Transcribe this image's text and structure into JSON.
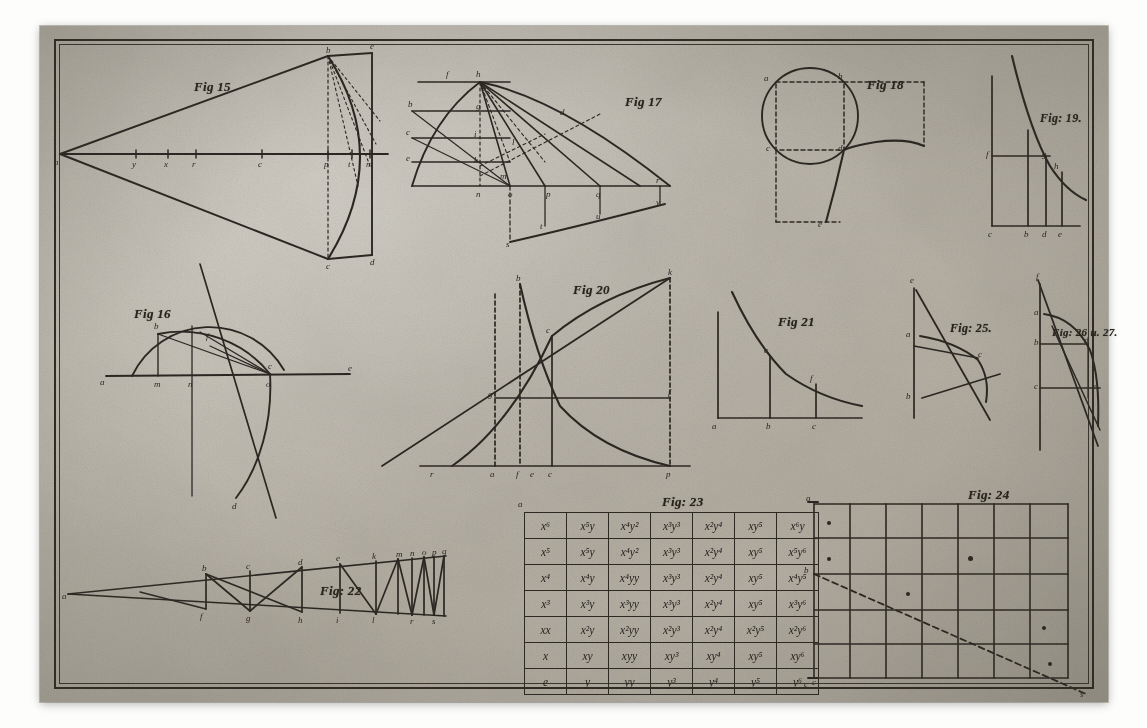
{
  "plate": {
    "title": "Engraved geometrical plate",
    "paper_color": "#bab5a9",
    "ink_color": "#2b2822",
    "border_style": "double ruled rectangle"
  },
  "figures": [
    {
      "id": "fig15",
      "label": "Fig 15",
      "caption_x": 154,
      "caption_y": 53,
      "size": 13,
      "description": "Elongated triangle (cone section) from apex at left to a vertical line at right, with a circular arc bulging right and dotted chords from the apex point",
      "point_labels": [
        "a",
        "b",
        "c",
        "d",
        "e",
        "f",
        "g",
        "h",
        "i",
        "k",
        "m",
        "n"
      ]
    },
    {
      "id": "fig16",
      "label": "Fig 16",
      "caption_x": 94,
      "caption_y": 280,
      "size": 13,
      "description": "Semicircle on a horizontal axis with an oblique tangent line, inner ellipse arc and chord construction",
      "point_labels": [
        "a",
        "b",
        "c",
        "d",
        "e",
        "f",
        "m",
        "n",
        "o",
        "p"
      ]
    },
    {
      "id": "fig17",
      "label": "Fig 17",
      "caption_x": 585,
      "caption_y": 68,
      "size": 13,
      "description": "Curve with family of parallel horizontal ordinates, oblique rays converging right and a lower curve with projected points",
      "point_labels": [
        "a",
        "b",
        "c",
        "d",
        "e",
        "f",
        "g",
        "h",
        "i",
        "k",
        "l",
        "m",
        "n",
        "o",
        "p",
        "q",
        "r"
      ]
    },
    {
      "id": "fig18",
      "label": "Fig 18",
      "caption_x": 827,
      "caption_y": 51,
      "size": 13,
      "description": "Circle with inscribed square, dashed rectangle at right and a descending curve through the square corner",
      "point_labels": [
        "a",
        "b",
        "c",
        "d",
        "e",
        "f"
      ]
    },
    {
      "id": "fig19",
      "label": "Fig: 19.",
      "caption_x": 1000,
      "caption_y": 85,
      "size": 12,
      "description": "Hyperbola referred to its asymptotes with two ordinates and a horizontal abscissa",
      "point_labels": [
        "a",
        "b",
        "c",
        "d",
        "e"
      ]
    },
    {
      "id": "fig20",
      "label": "Fig 20",
      "caption_x": 533,
      "caption_y": 256,
      "size": 13,
      "description": "Rising logarithmic curve crossing a descending hyperbola inside a rectangle, with an oblique straight line from lower left",
      "point_labels": [
        "a",
        "b",
        "c",
        "d",
        "e",
        "f",
        "g",
        "i",
        "k"
      ]
    },
    {
      "id": "fig21",
      "label": "Fig 21",
      "caption_x": 738,
      "caption_y": 288,
      "size": 13,
      "description": "Hyperbola above a horizontal axis with two vertical ordinates",
      "point_labels": [
        "a",
        "b",
        "c",
        "d",
        "e"
      ]
    },
    {
      "id": "fig25",
      "label": "Fig: 25.",
      "caption_x": 910,
      "caption_y": 295,
      "size": 12,
      "description": "Vertical axis with circular arc, two horizontal ordinates and crossing oblique lines",
      "point_labels": [
        "a",
        "b",
        "c",
        "d",
        "e"
      ]
    },
    {
      "id": "fig26_27",
      "label": "Fig: 26 u. 27.",
      "caption_x": 1012,
      "caption_y": 300,
      "size": 11,
      "description": "Vertical axis with parabola-like arc, two ordinates and two descending oblique lines",
      "point_labels": [
        "a",
        "b",
        "c",
        "d",
        "e",
        "f"
      ]
    },
    {
      "id": "fig22",
      "label": "Fig: 22",
      "caption_x": 280,
      "caption_y": 557,
      "size": 13,
      "description": "Narrow wedge between two lines from a left apex, subdivided by verticals and diagonals into a converging zig-zag series",
      "point_labels": [
        "a",
        "b",
        "c",
        "d",
        "e",
        "f",
        "g",
        "h",
        "i",
        "k",
        "l",
        "m",
        "n",
        "o",
        "p",
        "q",
        "r",
        "s"
      ]
    },
    {
      "id": "fig23",
      "label": "Fig: 23",
      "caption_x": 622,
      "caption_y": 468,
      "size": 13,
      "description": "Seven by seven table of the monomials x^i y^j forming the terms of a binomial expansion square",
      "point_labels": [
        "a",
        "b",
        "c"
      ]
    },
    {
      "id": "fig24",
      "label": "Fig: 24",
      "caption_x": 928,
      "caption_y": 461,
      "size": 13,
      "description": "Rectangular lattice of seven by five cells crossed by a descending dashed diagonal, with dot marks in some cells",
      "point_labels": [
        "a",
        "b",
        "c"
      ]
    }
  ],
  "fig23_table": {
    "caption": "Fig: 23",
    "corner_labels": {
      "top_left": "a",
      "bottom_right": "c"
    },
    "rows": [
      [
        "x⁶",
        "x⁵y",
        "x⁴y²",
        "x³y³",
        "x²y⁴",
        "xy⁵",
        "x⁶y"
      ],
      [
        "x⁵",
        "x⁵y",
        "x⁴y²",
        "x³y³",
        "x²y⁴",
        "xy⁵",
        "x⁵y⁶"
      ],
      [
        "x⁴",
        "x⁴y",
        "x⁴yy",
        "x³y³",
        "x²y⁴",
        "xy⁵",
        "x⁴y⁵"
      ],
      [
        "x³",
        "x³y",
        "x³yy",
        "x³y³",
        "x²y⁴",
        "xy⁵",
        "x³y⁶"
      ],
      [
        "xx",
        "x²y",
        "x²yy",
        "x²y³",
        "x²y⁴",
        "x²y⁵",
        "x²y⁶"
      ],
      [
        "x",
        "xy",
        "xyy",
        "xy³",
        "xy⁴",
        "xy⁵",
        "xy⁶"
      ],
      [
        "e",
        "y",
        "yy",
        "y³",
        "y⁴",
        "y⁵",
        "y⁶"
      ]
    ]
  },
  "fig24_grid": {
    "caption": "Fig: 24",
    "columns": 7,
    "rows": 5,
    "diagonal": "dashed line from upper left corner b descending to lower right beyond the frame",
    "corner_labels": {
      "top_left": "a",
      "left_mid": "b",
      "bottom_left": "c",
      "right_end": "s"
    },
    "dot_marks": 6
  },
  "ticks_fig15": [
    "y",
    "x",
    "r",
    "c",
    "p",
    "t",
    "m"
  ],
  "ticks_fig19": [
    "c",
    "b",
    "d",
    "e"
  ],
  "ticks_fig20": [
    "r",
    "a",
    "f",
    "e",
    "c",
    "p"
  ],
  "ticks_fig21": [
    "a",
    "b",
    "c"
  ]
}
